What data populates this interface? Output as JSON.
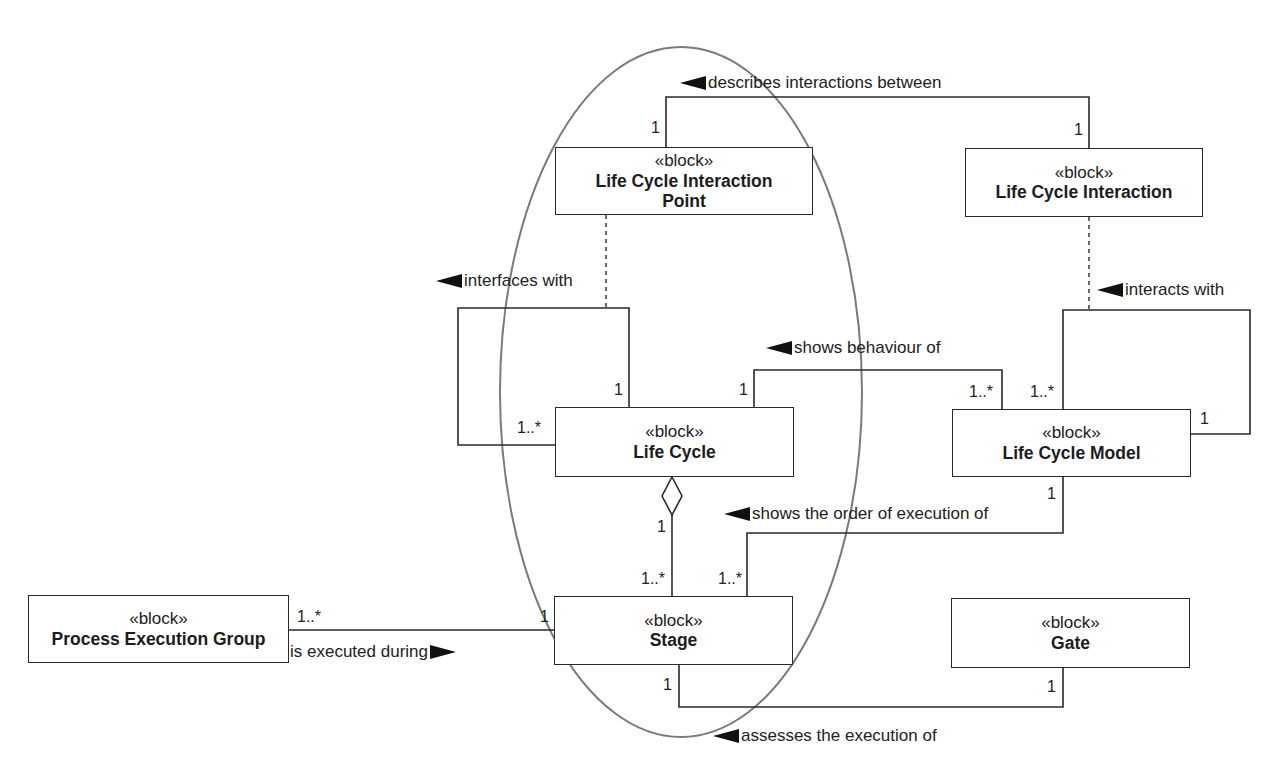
{
  "diagram": {
    "type": "SysML block definition diagram",
    "stereotype": "«block»",
    "blocks": [
      {
        "id": "lcip",
        "name": "Life Cycle Interaction Point"
      },
      {
        "id": "lci",
        "name": "Life Cycle Interaction"
      },
      {
        "id": "lc",
        "name": "Life Cycle"
      },
      {
        "id": "lcm",
        "name": "Life Cycle Model"
      },
      {
        "id": "stage",
        "name": "Stage"
      },
      {
        "id": "gate",
        "name": "Gate"
      },
      {
        "id": "peg",
        "name": "Process Execution Group"
      }
    ],
    "lcip_name_line1": "Life Cycle Interaction",
    "lcip_name_line2": "Point",
    "associations": [
      {
        "label": "describes interactions between",
        "direction": "left",
        "from": "Life Cycle Interaction",
        "to": "Life Cycle Interaction Point",
        "mult_a": "1",
        "mult_b": "1"
      },
      {
        "label": "interfaces with",
        "direction": "left",
        "from": "Life Cycle",
        "to": "Life Cycle",
        "mult_a": "1",
        "mult_b": "1..*"
      },
      {
        "label": "interacts with",
        "direction": "left",
        "from": "Life Cycle Model",
        "to": "Life Cycle Model",
        "mult_a": "1..*",
        "mult_b": "1"
      },
      {
        "label": "shows behaviour of",
        "direction": "left",
        "from": "Life Cycle Model",
        "to": "Life Cycle",
        "mult_a": "1",
        "mult_b": "1..*"
      },
      {
        "label": "shows the order of execution of",
        "direction": "left",
        "from": "Life Cycle Model",
        "to": "Stage",
        "mult_a": "1..*",
        "mult_b": "1"
      },
      {
        "label": "is executed during",
        "direction": "right",
        "from": "Process Execution Group",
        "to": "Stage",
        "mult_a": "1..*",
        "mult_b": "1"
      },
      {
        "label": "assesses the execution of",
        "direction": "left",
        "from": "Gate",
        "to": "Stage",
        "mult_a": "1",
        "mult_b": "1"
      }
    ],
    "aggregation": {
      "whole": "Life Cycle",
      "part": "Stage",
      "mult_whole": "1",
      "mult_part": "1..*"
    },
    "highlight_ellipse": {
      "encloses": [
        "Life Cycle Interaction Point",
        "Life Cycle",
        "Stage"
      ],
      "color": "#7a7a7a"
    }
  }
}
